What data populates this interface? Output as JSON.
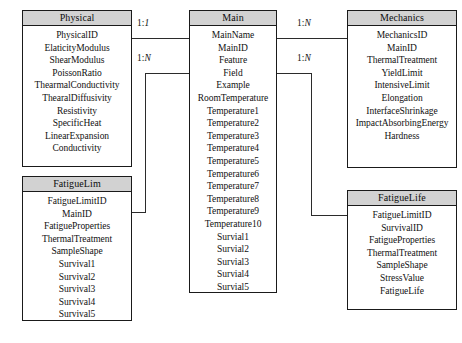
{
  "diagram": {
    "type": "er-diagram",
    "entities": [
      {
        "id": "physical",
        "name": "Physical",
        "x": 22,
        "y": 10,
        "width": 110,
        "height": 157,
        "attributes": [
          "PhysicalID",
          "ElaticityModulus",
          "ShearModulus",
          "PoissonRatio",
          "ThearmalConductivity",
          "ThearalDiffusivity",
          "Resistivity",
          "SpecificHeat",
          "LinearExpansion",
          "Conductivity"
        ]
      },
      {
        "id": "main",
        "name": "Main",
        "x": 189,
        "y": 10,
        "width": 88,
        "height": 283,
        "attributes": [
          "MainName",
          "MainID",
          "Feature",
          "Field",
          "Example",
          "RoomTemperature",
          "Temperature1",
          "Temperature2",
          "Temperature3",
          "Temperature4",
          "Temperature5",
          "Temperature6",
          "Temperature7",
          "Temperature8",
          "Temperature9",
          "Temperature10",
          "Survial1",
          "Survial2",
          "Survial3",
          "Survial4",
          "Survial5"
        ]
      },
      {
        "id": "mechanics",
        "name": "Mechanics",
        "x": 347,
        "y": 10,
        "width": 110,
        "height": 158,
        "attributes": [
          "MechanicsID",
          "MainID",
          "ThermalTreatment",
          "YieldLimit",
          "IntensiveLimit",
          "Elongation",
          "InterfaceShrinkage",
          "ImpactAbsorbingEnergy",
          "Hardness"
        ]
      },
      {
        "id": "fatiguelim",
        "name": "FatigueLim",
        "x": 22,
        "y": 176,
        "width": 110,
        "height": 145,
        "attributes": [
          "FatigueLimitID",
          "MainID",
          "FatigueProperties",
          "ThermalTreatment",
          "SampleShape",
          "Survival1",
          "Survival2",
          "Survival3",
          "Survival4",
          "Survival5"
        ]
      },
      {
        "id": "fatiguelife",
        "name": "FatigueLife",
        "x": 347,
        "y": 190,
        "width": 110,
        "height": 120,
        "attributes": [
          "FatigueLimitID",
          "SurvivalID",
          "FatigueProperties",
          "ThermalTreatment",
          "SampleShape",
          "StressValue",
          "FatigueLife"
        ]
      }
    ],
    "relationships": [
      {
        "id": "physical-main",
        "from": "Physical",
        "to": "Main",
        "cardinality": "1:1",
        "card_left": "1",
        "card_sep": ":",
        "card_right": "1"
      },
      {
        "id": "main-fatiguelim",
        "from": "Main",
        "to": "FatigueLim",
        "cardinality": "1:N",
        "card_left": "1",
        "card_sep": ":",
        "card_right": "N"
      },
      {
        "id": "main-mechanics",
        "from": "Main",
        "to": "Mechanics",
        "cardinality": "1:N",
        "card_left": "1",
        "card_sep": ":",
        "card_right": "N"
      },
      {
        "id": "main-fatiguelife",
        "from": "Main",
        "to": "FatigueLife",
        "cardinality": "1:N",
        "card_left": "1",
        "card_sep": ":",
        "card_right": "N"
      }
    ],
    "colors": {
      "header_fill": "#d2d2d2",
      "border": "#1a1a1a",
      "line": "#2b2b2b",
      "text": "#111111",
      "background": "#ffffff"
    }
  }
}
